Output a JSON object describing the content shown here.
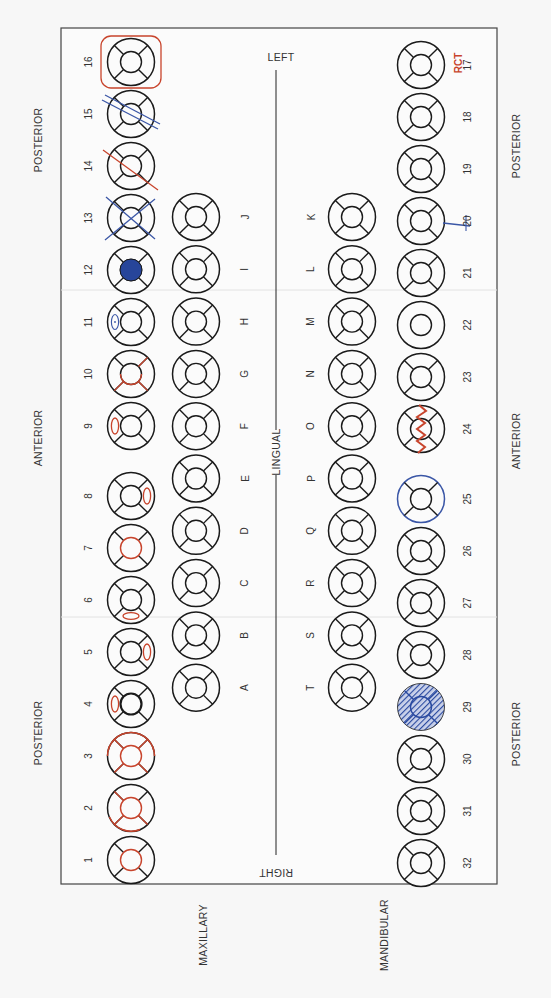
{
  "orientation_labels": {
    "left": "LEFT",
    "right": "RIGHT",
    "lingual": "LINGUAL",
    "outer_left": [
      "POSTERIOR",
      "ANTERIOR",
      "POSTERIOR"
    ],
    "outer_right": [
      "POSTERIOR",
      "ANTERIOR",
      "POSTERIOR"
    ],
    "maxillary": "MAXILLARY",
    "mandibular": "MANDIBULAR"
  },
  "colors": {
    "outline": "#1a1a1a",
    "red": "#c8442c",
    "blue": "#3a56a6",
    "blue_fill": "#27459a",
    "frame": "#444444",
    "text": "#333333"
  },
  "maxillary_permanent": [
    {
      "num": "16",
      "marks": [
        "red-box"
      ]
    },
    {
      "num": "15",
      "marks": [
        "blue-double-slash"
      ]
    },
    {
      "num": "14",
      "marks": [
        "red-slash"
      ]
    },
    {
      "num": "13",
      "marks": [
        "blue-x"
      ]
    },
    {
      "num": "12",
      "marks": [
        "blue-filled-occlusal"
      ]
    },
    {
      "num": "11",
      "marks": [
        "blue-facial-oval-dot"
      ]
    },
    {
      "num": "10",
      "marks": [
        "red-partial-lines"
      ]
    },
    {
      "num": "9",
      "marks": [
        "red-facial-oval"
      ]
    },
    {
      "num": "8",
      "marks": [
        "red-lingual-oval"
      ]
    },
    {
      "num": "7",
      "marks": [
        "red-occlusal-circle"
      ]
    },
    {
      "num": "6",
      "marks": [
        "red-mesial-oval"
      ]
    },
    {
      "num": "5",
      "marks": [
        "red-lingual-oval"
      ]
    },
    {
      "num": "4",
      "marks": [
        "red-facial-oval",
        "bold-occlusal"
      ]
    },
    {
      "num": "3",
      "marks": [
        "red-full"
      ]
    },
    {
      "num": "2",
      "marks": [
        "red-partial-full"
      ]
    },
    {
      "num": "1",
      "marks": [
        "red-occlusal-circle"
      ]
    }
  ],
  "maxillary_primary": [
    {
      "letter": "J"
    },
    {
      "letter": "I"
    },
    {
      "letter": "H"
    },
    {
      "letter": "G"
    },
    {
      "letter": "F"
    },
    {
      "letter": "E"
    },
    {
      "letter": "D"
    },
    {
      "letter": "C"
    },
    {
      "letter": "B"
    },
    {
      "letter": "A"
    }
  ],
  "mandibular_primary": [
    {
      "letter": "K"
    },
    {
      "letter": "L"
    },
    {
      "letter": "M"
    },
    {
      "letter": "N"
    },
    {
      "letter": "O"
    },
    {
      "letter": "P"
    },
    {
      "letter": "Q"
    },
    {
      "letter": "R"
    },
    {
      "letter": "S"
    },
    {
      "letter": "T"
    }
  ],
  "mandibular_permanent": [
    {
      "num": "17",
      "marks": [],
      "note": "RCT"
    },
    {
      "num": "18",
      "marks": []
    },
    {
      "num": "19",
      "marks": []
    },
    {
      "num": "20",
      "marks": [
        "blue-root-line"
      ]
    },
    {
      "num": "21",
      "marks": []
    },
    {
      "num": "22",
      "marks": [
        "no-dividers"
      ]
    },
    {
      "num": "23",
      "marks": []
    },
    {
      "num": "24",
      "marks": [
        "red-zigzag"
      ]
    },
    {
      "num": "25",
      "marks": [
        "blue-outline-crown"
      ]
    },
    {
      "num": "26",
      "marks": []
    },
    {
      "num": "27",
      "marks": []
    },
    {
      "num": "28",
      "marks": []
    },
    {
      "num": "29",
      "marks": [
        "blue-hatched"
      ]
    },
    {
      "num": "30",
      "marks": []
    },
    {
      "num": "31",
      "marks": []
    },
    {
      "num": "32",
      "marks": []
    }
  ]
}
